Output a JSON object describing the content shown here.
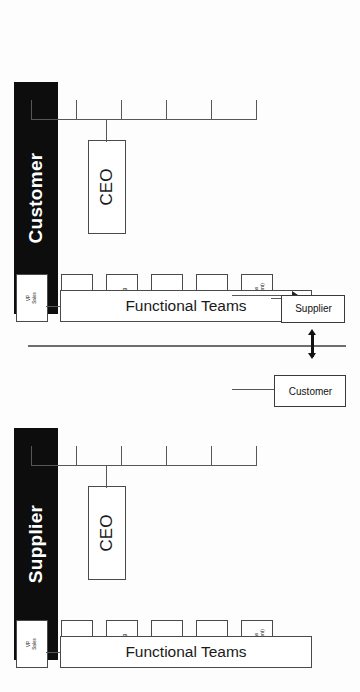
{
  "diagram": {
    "type": "org-chart",
    "orientation": "rotated-90-ccw",
    "divider_label": "",
    "colors": {
      "banner_bg": "#0d0d0d",
      "banner_text": "#ffffff",
      "box_border": "#4a4a4a",
      "box_bg": "#ffffff",
      "line": "#575757",
      "page_bg": "#fdfdfd"
    }
  },
  "halves": [
    {
      "id": "customer",
      "banner_label": "Customer",
      "root": {
        "label": "CEO"
      },
      "functional_teams": {
        "label": "Functional Teams"
      },
      "vps": [
        {
          "line1": "VP",
          "line2": "Sales",
          "line3": ""
        },
        {
          "line1": "VP",
          "line2": "HR",
          "line3": ""
        },
        {
          "line1": "VP",
          "line2": "Marketing",
          "line3": ""
        },
        {
          "line1": "VP",
          "line2": "Finance",
          "line3": ""
        },
        {
          "line1": "VP",
          "line2": "IT",
          "line3": ""
        },
        {
          "line1": "VP",
          "line2": "Operations",
          "line3": "(Procurement)"
        }
      ],
      "external_link": {
        "from_vp": "VP Operations (Procurement)",
        "to_label": "Supplier"
      }
    },
    {
      "id": "supplier",
      "banner_label": "Supplier",
      "root": {
        "label": "CEO"
      },
      "functional_teams": {
        "label": "Functional Teams"
      },
      "vps": [
        {
          "line1": "VP",
          "line2": "Sales",
          "line3": ""
        },
        {
          "line1": "VP",
          "line2": "HR",
          "line3": ""
        },
        {
          "line1": "VP",
          "line2": "Marketing",
          "line3": ""
        },
        {
          "line1": "VP",
          "line2": "Finance",
          "line3": ""
        },
        {
          "line1": "VP",
          "line2": "IT",
          "line3": ""
        },
        {
          "line1": "VP",
          "line2": "Operations",
          "line3": "(Procurement)"
        }
      ],
      "external_link": {
        "from_vp": "VP Sales",
        "to_label": "Customer"
      }
    }
  ],
  "partner_boxes": {
    "supplier_box_label": "Supplier",
    "customer_box_label": "Customer"
  }
}
